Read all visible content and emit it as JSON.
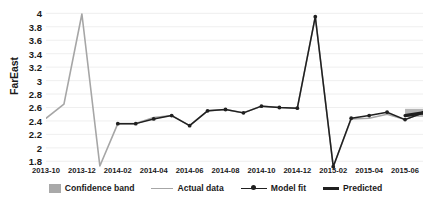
{
  "chart_data": {
    "type": "line",
    "title": "",
    "xlabel": "",
    "ylabel": "FarEast",
    "ylim": [
      1.7,
      4.05
    ],
    "yticks": [
      "1.8",
      "2",
      "2.2",
      "2.4",
      "2.6",
      "2.8",
      "3",
      "3.2",
      "3.4",
      "3.6",
      "3.8",
      "4"
    ],
    "ytick_values": [
      1.8,
      2,
      2.2,
      2.4,
      2.6,
      2.8,
      3,
      3.2,
      3.4,
      3.6,
      3.8,
      4
    ],
    "xticks": [
      "2013-10",
      "2013-12",
      "2014-02",
      "2014-04",
      "2014-06",
      "2014-08",
      "2014-10",
      "2014-12",
      "2015-02",
      "2015-04",
      "2015-06"
    ],
    "x": [
      "2013-10",
      "2013-11",
      "2013-12",
      "2014-01",
      "2014-02",
      "2014-03",
      "2014-04",
      "2014-05",
      "2014-06",
      "2014-07",
      "2014-08",
      "2014-09",
      "2014-10",
      "2014-11",
      "2014-12",
      "2015-01",
      "2015-02",
      "2015-03",
      "2015-04",
      "2015-05",
      "2015-06",
      "2015-07"
    ],
    "grid": true,
    "legend_position": "bottom",
    "series": [
      {
        "name": "Actual data",
        "color": "#a6a6a6",
        "values": [
          2.44,
          2.65,
          3.99,
          1.73,
          2.36,
          2.36,
          2.45,
          2.48,
          2.33,
          2.55,
          2.57,
          2.52,
          2.62,
          2.6,
          2.59,
          3.95,
          1.72,
          2.43,
          2.44,
          2.5,
          2.42,
          2.52
        ]
      },
      {
        "name": "Model fit",
        "color": "#202020",
        "values": [
          null,
          null,
          null,
          null,
          2.36,
          2.36,
          2.43,
          2.48,
          2.33,
          2.55,
          2.57,
          2.52,
          2.62,
          2.6,
          2.59,
          3.95,
          1.72,
          2.44,
          2.48,
          2.53,
          2.42,
          2.52
        ]
      },
      {
        "name": "Predicted",
        "color": "#202020",
        "values": [
          null,
          null,
          null,
          null,
          null,
          null,
          null,
          null,
          null,
          null,
          null,
          null,
          null,
          null,
          null,
          null,
          null,
          null,
          null,
          null,
          2.48,
          2.52
        ]
      }
    ],
    "confidence_band": {
      "name": "Confidence band",
      "color": "#a9a9a9",
      "x_start": "2015-06",
      "x_end": "2015-07",
      "lower": 2.46,
      "upper": 2.58
    }
  },
  "legend": {
    "items": [
      {
        "label": "Confidence band",
        "marker": "band-swatch"
      },
      {
        "label": "Actual data",
        "marker": "line-light"
      },
      {
        "label": "Model fit",
        "marker": "line-marker"
      },
      {
        "label": "Predicted",
        "marker": "line-thick"
      }
    ]
  }
}
